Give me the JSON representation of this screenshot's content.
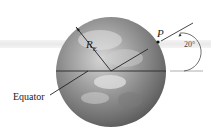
{
  "diagram": {
    "labels": {
      "equator": "Equator",
      "radius_symbol": "R",
      "radius_subscript": "E",
      "point": "P",
      "angle": "20°"
    },
    "colors": {
      "globe_dark": "#6a6a6a",
      "globe_light": "#c8c8c8",
      "line": "#222222",
      "guide": "#999999"
    }
  }
}
